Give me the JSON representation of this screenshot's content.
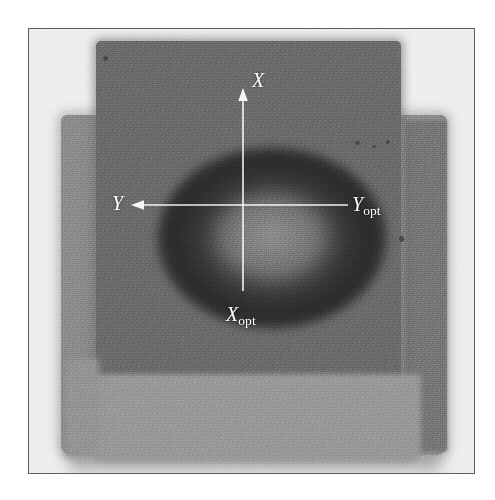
{
  "figure": {
    "kind": "radiograph-photograph",
    "frame": {
      "border_color": "#5e5e5e",
      "background_color": "#efefed"
    }
  },
  "specimen": {
    "blocks": [
      {
        "name": "front-slab",
        "tone": "#6e6e6e"
      },
      {
        "name": "rear-slab",
        "tone": "#8e8e8e"
      },
      {
        "name": "lower-band",
        "tone": "#9b9b9b"
      },
      {
        "name": "right-strip",
        "tone": "#797979"
      }
    ],
    "feature": {
      "name": "central-ring-defect",
      "shape": "annulus",
      "dark_tone": "#2a2a2a",
      "core_tone": "#afafaf"
    }
  },
  "annotations": {
    "crosshair": {
      "center_x": 243,
      "center_y": 205,
      "line_color": "#ffffff",
      "arrow_color": "#ffffff"
    },
    "labels": {
      "x": {
        "text": "X",
        "sub": ""
      },
      "y": {
        "text": "Y",
        "sub": ""
      },
      "y_opt": {
        "text": "Y",
        "sub": "opt"
      },
      "x_opt": {
        "text": "X",
        "sub": "opt"
      }
    }
  },
  "specks": [
    {
      "x": 356,
      "y": 142,
      "r": 2.4
    },
    {
      "x": 372,
      "y": 145,
      "r": 1.8
    },
    {
      "x": 386,
      "y": 140,
      "r": 2.0
    },
    {
      "x": 104,
      "y": 56,
      "r": 2.2
    },
    {
      "x": 399,
      "y": 236,
      "r": 2.6
    }
  ]
}
